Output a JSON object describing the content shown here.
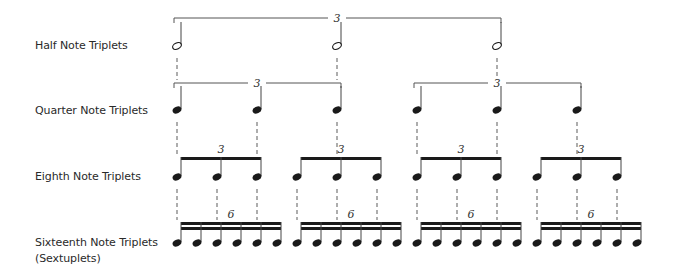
{
  "rows": [
    {
      "id": "half",
      "label": "Half Note Triplets",
      "label_y": 38,
      "note_type": "half",
      "head_y": 46,
      "stem_top": 22,
      "notes_x": [
        177,
        337,
        497
      ],
      "groups": [
        {
          "type": "bracket",
          "x1": 174,
          "x2": 501,
          "y": 18,
          "number": "3",
          "number_x": 337
        }
      ]
    },
    {
      "id": "quarter",
      "label": "Quarter Note Triplets",
      "label_y": 103,
      "note_type": "quarter",
      "head_y": 110,
      "stem_top": 86,
      "notes_x": [
        177,
        257,
        337,
        417,
        497,
        577
      ],
      "groups": [
        {
          "type": "bracket",
          "x1": 174,
          "x2": 341,
          "y": 83,
          "number": "3",
          "number_x": 257
        },
        {
          "type": "bracket",
          "x1": 414,
          "x2": 581,
          "y": 83,
          "number": "3",
          "number_x": 497
        }
      ]
    },
    {
      "id": "eighth",
      "label": "Eighth Note Triplets",
      "label_y": 169,
      "note_type": "eighth",
      "head_y": 177,
      "stem_top": 157,
      "notes_x": [
        177,
        217,
        257,
        297,
        337,
        377,
        417,
        457,
        497,
        537,
        577,
        617
      ],
      "groups": [
        {
          "type": "beam",
          "count": 1,
          "x1": 181,
          "x2": 261,
          "y": 157,
          "number": "3",
          "number_x": 221
        },
        {
          "type": "beam",
          "count": 1,
          "x1": 301,
          "x2": 381,
          "y": 157,
          "number": "3",
          "number_x": 341
        },
        {
          "type": "beam",
          "count": 1,
          "x1": 421,
          "x2": 501,
          "y": 157,
          "number": "3",
          "number_x": 461
        },
        {
          "type": "beam",
          "count": 1,
          "x1": 541,
          "x2": 621,
          "y": 157,
          "number": "3",
          "number_x": 581
        }
      ]
    },
    {
      "id": "sixteenth",
      "label": "Sixteenth Note Triplets",
      "label2": "(Sextuplets)",
      "label_y": 235,
      "note_type": "sixteenth",
      "head_y": 243,
      "stem_top": 222,
      "notes_x": [
        177,
        197,
        217,
        237,
        257,
        277,
        297,
        317,
        337,
        357,
        377,
        397,
        417,
        437,
        457,
        477,
        497,
        517,
        537,
        557,
        577,
        597,
        617,
        637
      ],
      "groups": [
        {
          "type": "beam",
          "count": 2,
          "x1": 181,
          "x2": 281,
          "y": 222,
          "number": "6",
          "number_x": 231
        },
        {
          "type": "beam",
          "count": 2,
          "x1": 301,
          "x2": 401,
          "y": 222,
          "number": "6",
          "number_x": 351
        },
        {
          "type": "beam",
          "count": 2,
          "x1": 421,
          "x2": 521,
          "y": 222,
          "number": "6",
          "number_x": 471
        },
        {
          "type": "beam",
          "count": 2,
          "x1": 541,
          "x2": 641,
          "y": 222,
          "number": "6",
          "number_x": 591
        }
      ]
    }
  ],
  "connectors": [
    {
      "from_row": "half",
      "to_row": "quarter",
      "xs": [
        177,
        337,
        497
      ],
      "y1": 58,
      "y2": 80
    },
    {
      "from_row": "quarter",
      "to_row": "eighth",
      "xs": [
        177,
        257,
        337,
        417,
        497,
        577
      ],
      "y1": 122,
      "y2": 154
    },
    {
      "from_row": "eighth",
      "to_row": "sixteenth",
      "xs": [
        177,
        217,
        257,
        297,
        337,
        377,
        417,
        457,
        497,
        537,
        577,
        617
      ],
      "y1": 189,
      "y2": 220
    }
  ],
  "colors": {
    "ink": "#1a1a1a",
    "bracket": "#555555",
    "dashed": "#777777",
    "label": "#2a2a2a"
  }
}
